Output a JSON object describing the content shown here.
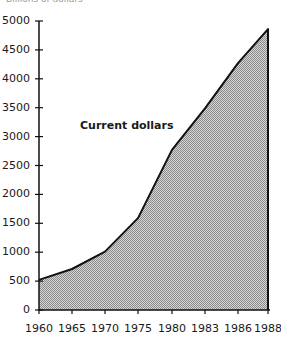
{
  "chart_data": {
    "type": "area",
    "title": "",
    "unit_label": "Billions of dollars",
    "xlabel": "",
    "ylabel": "Billions of dollars",
    "annotation": "Current dollars",
    "categories": [
      "1960",
      "1965",
      "1970",
      "1975",
      "1980",
      "1983",
      "1986",
      "1988"
    ],
    "series": [
      {
        "name": "Current dollars",
        "values": [
          520,
          710,
          1010,
          1590,
          2770,
          3490,
          4270,
          4860
        ]
      }
    ],
    "yticks": [
      0,
      500,
      1000,
      1500,
      2000,
      2500,
      3000,
      3500,
      4000,
      4500,
      5000
    ],
    "ylim": [
      0,
      5000
    ],
    "grid": false,
    "legend": "none",
    "fill": "dotted gray",
    "colors": {
      "line": "#111111",
      "fill": "#b8b8b8",
      "axis": "#111111"
    }
  }
}
